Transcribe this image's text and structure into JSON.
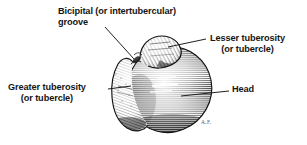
{
  "figure": {
    "background_color": "#ffffff",
    "ink_color": "#151515",
    "signature": "A.F.",
    "labels": [
      {
        "id": "bicipital",
        "name": "bicipital-groove-label",
        "line1": "Bicipital (or intertubercular)",
        "line2": "groove"
      },
      {
        "id": "lesser",
        "name": "lesser-tuberosity-label",
        "line1": "Lesser tuberosity",
        "line2": "(or tubercle)"
      },
      {
        "id": "greater",
        "name": "greater-tuberosity-label",
        "line1": "Greater tuberosity",
        "line2": "(or tubercle)"
      },
      {
        "id": "head",
        "name": "head-label",
        "line1": "Head",
        "line2": ""
      }
    ]
  }
}
